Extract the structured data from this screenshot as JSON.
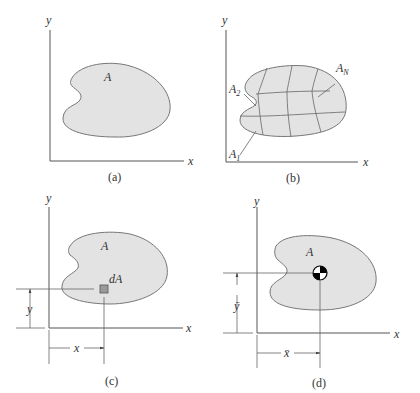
{
  "figure": {
    "panels": [
      {
        "id": "a",
        "caption": "(a)",
        "x_label": "x",
        "y_label": "y",
        "area_label": "A"
      },
      {
        "id": "b",
        "caption": "(b)",
        "x_label": "x",
        "y_label": "y",
        "element_labels": {
          "first": "A",
          "first_sub": "1",
          "second": "A",
          "second_sub": "2",
          "last": "A",
          "last_sub": "N"
        }
      },
      {
        "id": "c",
        "caption": "(c)",
        "x_label": "x",
        "y_label": "y",
        "area_label": "A",
        "element_label": "dA",
        "dim_x": "x",
        "dim_y": "y"
      },
      {
        "id": "d",
        "caption": "(d)",
        "x_label": "x",
        "y_label": "y",
        "area_label": "A",
        "dim_x": "x̄",
        "dim_y": "ȳ"
      }
    ],
    "colors": {
      "area_fill": "#e3e3e3",
      "outline": "#777777",
      "element_fill": "#9a9a9a",
      "centroid_dark": "#000000"
    }
  }
}
